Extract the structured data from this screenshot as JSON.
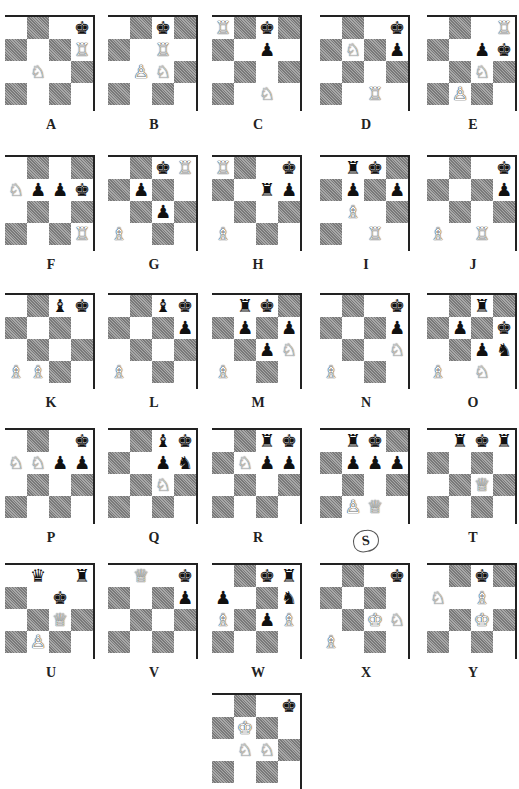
{
  "page": {
    "piece_glyphs": {
      "wK": "♔",
      "wQ": "♕",
      "wR": "♖",
      "wB": "♗",
      "wN": "♘",
      "wP": "♙",
      "bK": "♚",
      "bQ": "♛",
      "bR": "♜",
      "bB": "♝",
      "bN": "♞",
      "bP": "♟"
    },
    "colors": {
      "dark_square": "#8e8e8e",
      "light_square": "#ffffff",
      "border": "#222222"
    }
  },
  "diagrams": [
    {
      "label": "A",
      "x": 5,
      "y": 15,
      "pieces": [
        [
          0,
          3,
          "bK"
        ],
        [
          1,
          3,
          "wR"
        ],
        [
          2,
          1,
          "wN"
        ]
      ]
    },
    {
      "label": "B",
      "x": 108,
      "y": 15,
      "pieces": [
        [
          0,
          2,
          "bK"
        ],
        [
          1,
          2,
          "wR"
        ],
        [
          2,
          1,
          "wP"
        ],
        [
          2,
          2,
          "wN"
        ]
      ]
    },
    {
      "label": "C",
      "x": 212,
      "y": 15,
      "pieces": [
        [
          0,
          0,
          "wR"
        ],
        [
          0,
          2,
          "bK"
        ],
        [
          1,
          2,
          "bP"
        ],
        [
          3,
          2,
          "wN"
        ]
      ]
    },
    {
      "label": "D",
      "x": 320,
      "y": 15,
      "pieces": [
        [
          0,
          3,
          "bK"
        ],
        [
          1,
          1,
          "wN"
        ],
        [
          1,
          3,
          "bP"
        ],
        [
          3,
          2,
          "wR"
        ]
      ]
    },
    {
      "label": "E",
      "x": 427,
      "y": 15,
      "pieces": [
        [
          0,
          3,
          "wR"
        ],
        [
          1,
          2,
          "bP"
        ],
        [
          1,
          3,
          "bK"
        ],
        [
          2,
          2,
          "wN"
        ],
        [
          3,
          1,
          "wP"
        ]
      ]
    },
    {
      "label": "F",
      "x": 5,
      "y": 155,
      "pieces": [
        [
          1,
          0,
          "wN"
        ],
        [
          1,
          1,
          "bP"
        ],
        [
          1,
          2,
          "bP"
        ],
        [
          1,
          3,
          "bK"
        ],
        [
          3,
          3,
          "wR"
        ]
      ]
    },
    {
      "label": "G",
      "x": 108,
      "y": 155,
      "pieces": [
        [
          0,
          2,
          "bK"
        ],
        [
          0,
          3,
          "wR"
        ],
        [
          1,
          1,
          "bP"
        ],
        [
          2,
          2,
          "bP"
        ],
        [
          3,
          0,
          "wB"
        ]
      ]
    },
    {
      "label": "H",
      "x": 212,
      "y": 155,
      "pieces": [
        [
          0,
          0,
          "wR"
        ],
        [
          0,
          3,
          "bK"
        ],
        [
          1,
          2,
          "bR"
        ],
        [
          1,
          3,
          "bP"
        ],
        [
          3,
          0,
          "wB"
        ]
      ]
    },
    {
      "label": "I",
      "x": 320,
      "y": 155,
      "pieces": [
        [
          0,
          1,
          "bR"
        ],
        [
          0,
          2,
          "bK"
        ],
        [
          1,
          1,
          "bP"
        ],
        [
          1,
          3,
          "bP"
        ],
        [
          2,
          1,
          "wB"
        ],
        [
          3,
          2,
          "wR"
        ]
      ]
    },
    {
      "label": "J",
      "x": 427,
      "y": 155,
      "pieces": [
        [
          0,
          3,
          "bK"
        ],
        [
          1,
          3,
          "bP"
        ],
        [
          3,
          0,
          "wB"
        ],
        [
          3,
          2,
          "wR"
        ]
      ]
    },
    {
      "label": "K",
      "x": 5,
      "y": 293,
      "pieces": [
        [
          0,
          2,
          "bB"
        ],
        [
          0,
          3,
          "bK"
        ],
        [
          3,
          0,
          "wB"
        ],
        [
          3,
          1,
          "wB"
        ]
      ]
    },
    {
      "label": "L",
      "x": 108,
      "y": 293,
      "pieces": [
        [
          0,
          2,
          "bB"
        ],
        [
          0,
          3,
          "bK"
        ],
        [
          1,
          3,
          "bP"
        ],
        [
          3,
          0,
          "wB"
        ]
      ]
    },
    {
      "label": "M",
      "x": 212,
      "y": 293,
      "pieces": [
        [
          0,
          1,
          "bR"
        ],
        [
          0,
          2,
          "bK"
        ],
        [
          1,
          1,
          "bP"
        ],
        [
          1,
          3,
          "bP"
        ],
        [
          2,
          2,
          "bP"
        ],
        [
          2,
          3,
          "wN"
        ],
        [
          3,
          0,
          "wB"
        ]
      ]
    },
    {
      "label": "N",
      "x": 320,
      "y": 293,
      "pieces": [
        [
          0,
          3,
          "bK"
        ],
        [
          1,
          3,
          "bP"
        ],
        [
          2,
          3,
          "wN"
        ],
        [
          3,
          0,
          "wB"
        ]
      ]
    },
    {
      "label": "O",
      "x": 427,
      "y": 293,
      "pieces": [
        [
          0,
          2,
          "bR"
        ],
        [
          1,
          1,
          "bP"
        ],
        [
          1,
          3,
          "bK"
        ],
        [
          2,
          2,
          "bP"
        ],
        [
          2,
          3,
          "bN"
        ],
        [
          3,
          0,
          "wB"
        ],
        [
          3,
          2,
          "wN"
        ]
      ]
    },
    {
      "label": "P",
      "x": 5,
      "y": 428,
      "pieces": [
        [
          0,
          3,
          "bK"
        ],
        [
          1,
          0,
          "wN"
        ],
        [
          1,
          1,
          "wN"
        ],
        [
          1,
          2,
          "bP"
        ],
        [
          1,
          3,
          "bP"
        ]
      ]
    },
    {
      "label": "Q",
      "x": 108,
      "y": 428,
      "pieces": [
        [
          0,
          2,
          "bB"
        ],
        [
          0,
          3,
          "bK"
        ],
        [
          1,
          2,
          "bP"
        ],
        [
          1,
          3,
          "bN"
        ],
        [
          2,
          2,
          "wN"
        ]
      ]
    },
    {
      "label": "R",
      "x": 212,
      "y": 428,
      "pieces": [
        [
          0,
          2,
          "bR"
        ],
        [
          0,
          3,
          "bK"
        ],
        [
          1,
          1,
          "wN"
        ],
        [
          1,
          2,
          "bP"
        ],
        [
          1,
          3,
          "bP"
        ]
      ]
    },
    {
      "label": "S",
      "x": 320,
      "y": 428,
      "circled": true,
      "pieces": [
        [
          0,
          1,
          "bR"
        ],
        [
          0,
          2,
          "bK"
        ],
        [
          1,
          1,
          "bP"
        ],
        [
          1,
          2,
          "bP"
        ],
        [
          1,
          3,
          "bP"
        ],
        [
          3,
          1,
          "wP"
        ],
        [
          3,
          2,
          "wQ"
        ]
      ]
    },
    {
      "label": "T",
      "x": 427,
      "y": 428,
      "pieces": [
        [
          0,
          1,
          "bR"
        ],
        [
          0,
          2,
          "bK"
        ],
        [
          0,
          3,
          "bR"
        ],
        [
          2,
          2,
          "wQ"
        ]
      ]
    },
    {
      "label": "U",
      "x": 5,
      "y": 563,
      "pieces": [
        [
          0,
          1,
          "bQ"
        ],
        [
          0,
          3,
          "bR"
        ],
        [
          1,
          2,
          "bK"
        ],
        [
          2,
          2,
          "wQ"
        ],
        [
          3,
          1,
          "wP"
        ]
      ]
    },
    {
      "label": "V",
      "x": 108,
      "y": 563,
      "pieces": [
        [
          0,
          1,
          "wQ"
        ],
        [
          0,
          3,
          "bK"
        ],
        [
          1,
          3,
          "bP"
        ]
      ]
    },
    {
      "label": "W",
      "x": 212,
      "y": 563,
      "pieces": [
        [
          0,
          2,
          "bK"
        ],
        [
          0,
          3,
          "bR"
        ],
        [
          1,
          0,
          "bP"
        ],
        [
          1,
          3,
          "bN"
        ],
        [
          2,
          0,
          "wB"
        ],
        [
          2,
          2,
          "bP"
        ],
        [
          2,
          3,
          "wB"
        ]
      ]
    },
    {
      "label": "X",
      "x": 320,
      "y": 563,
      "pieces": [
        [
          0,
          3,
          "bK"
        ],
        [
          2,
          2,
          "wK"
        ],
        [
          2,
          3,
          "wN"
        ],
        [
          3,
          0,
          "wB"
        ]
      ]
    },
    {
      "label": "Y",
      "x": 427,
      "y": 563,
      "pieces": [
        [
          0,
          2,
          "bK"
        ],
        [
          1,
          0,
          "wN"
        ],
        [
          1,
          2,
          "wB"
        ],
        [
          2,
          2,
          "wK"
        ]
      ]
    },
    {
      "label": "",
      "x": 212,
      "y": 693,
      "pieces": [
        [
          0,
          3,
          "bK"
        ],
        [
          1,
          1,
          "wK"
        ],
        [
          2,
          1,
          "wN"
        ],
        [
          2,
          2,
          "wN"
        ]
      ]
    }
  ]
}
